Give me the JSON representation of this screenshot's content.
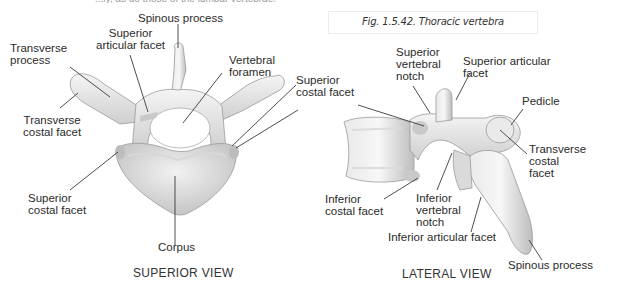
{
  "page": {
    "top_text_fragment": "...ly, as do those of the lumbar vertebrae."
  },
  "caption": "Fig. 1.5.42. Thoracic vertebra",
  "superior_view": {
    "title": "SUPERIOR VIEW",
    "labels": {
      "spinous_process": "Spinous process",
      "superior_articular_facet": "Superior\narticular facet",
      "transverse_process": "Transverse\nprocess",
      "vertebral_foramen": "Vertebral\nforamen",
      "transverse_costal_facet": "Transverse\ncostal facet",
      "superior_costal_facet_right": "Superior\ncostal facet",
      "superior_costal_facet_left": "Superior\ncostal facet",
      "corpus": "Corpus"
    }
  },
  "lateral_view": {
    "title": "LATERAL VIEW",
    "labels": {
      "superior_vertebral_notch": "Superior\nvertebral\nnotch",
      "superior_articular_facet": "Superior articular\nfacet",
      "pedicle": "Pedicle",
      "transverse_costal_facet": "Transverse\ncostal\nfacet",
      "inferior_costal_facet": "Inferior\ncostal facet",
      "inferior_vertebral_notch": "Inferior\nvertebral\nnotch",
      "inferior_articular_facet": "Inferior articular facet",
      "spinous_process": "Spinous process"
    }
  },
  "colors": {
    "bone_light": "#f1f1f1",
    "bone_mid": "#d6d6d6",
    "bone_shadow": "#a9a9a9",
    "leader_line": "#3a3a3a",
    "text": "#2b2b2b"
  }
}
